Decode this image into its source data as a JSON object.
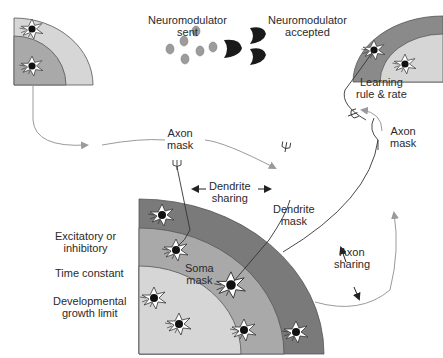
{
  "colors": {
    "band_dark": "#7a7a7a",
    "band_mid": "#a9a9a9",
    "band_light": "#d6d6d6",
    "outline": "#555555",
    "arrow_gray": "#9a9a9a",
    "neuron_body": "#ffffff",
    "nucleus": "#111111",
    "receptor": "#1a1a1a",
    "molecule": "#9c9c9c",
    "text": "#2a2a2a"
  },
  "labels": {
    "neuromodulator_sent": [
      "Neuromodulator",
      "sent"
    ],
    "neuromodulator_accepted": [
      "Neuromodulator",
      "accepted"
    ],
    "learning_rule": [
      "Learning",
      "rule & rate"
    ],
    "axon_mask_top": [
      "Axon",
      "mask"
    ],
    "axon_mask_right": [
      "Axon",
      "mask"
    ],
    "dendrite_sharing": [
      "Dendrite",
      "sharing"
    ],
    "dendrite_mask": [
      "Dendrite",
      "mask"
    ],
    "soma_mask": [
      "Soma",
      "mask"
    ],
    "axon_sharing": [
      "Axon",
      "sharing"
    ],
    "excitatory": [
      "Excitatory or",
      "inhibitory"
    ],
    "time_constant": [
      "Time constant"
    ],
    "developmental": [
      "Developmental",
      "growth limit"
    ]
  },
  "panels": [
    {
      "name": "top-left-quadrant",
      "neurons": 2
    },
    {
      "name": "top-right-quadrant",
      "neurons": 2
    },
    {
      "name": "main-quadrant",
      "neurons": 7
    }
  ]
}
